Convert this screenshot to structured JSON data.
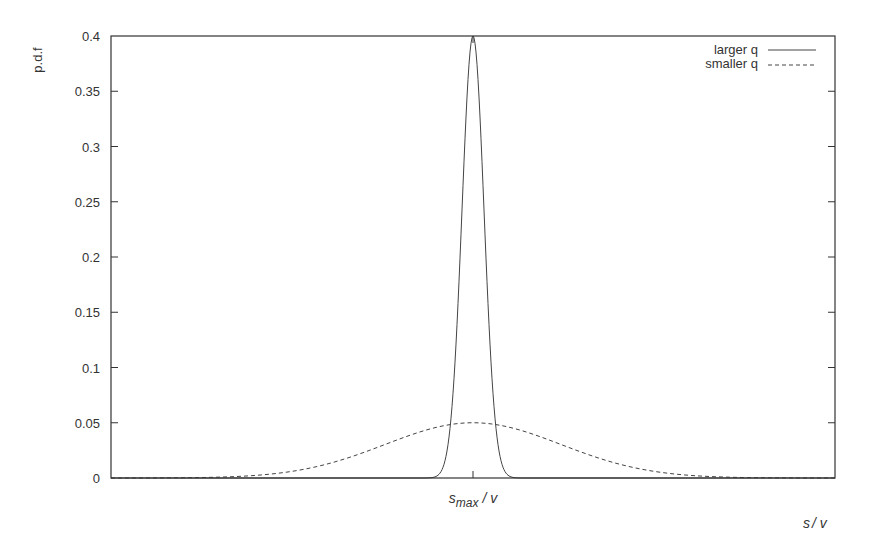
{
  "chart_data": {
    "type": "line",
    "title": "",
    "xlabel": "s/ v",
    "ylabel": "p.d.f",
    "ylim": [
      0,
      0.4
    ],
    "yticks": [
      0,
      0.05,
      0.1,
      0.15,
      0.2,
      0.25,
      0.3,
      0.35,
      0.4
    ],
    "ytick_labels": [
      "0",
      "0.05",
      "0.1",
      "0.15",
      "0.2",
      "0.25",
      "0.3",
      "0.35",
      "0.4"
    ],
    "xticks": [
      "s_max / v"
    ],
    "xtick_label": {
      "main": "s",
      "sub": "max",
      "rest": " / v"
    },
    "grid": false,
    "legend_position": "top-right",
    "series": [
      {
        "name": "larger q",
        "style": "solid",
        "shape": "gaussian",
        "center": "s_max / v",
        "peak": 0.4,
        "sigma_rel": 1
      },
      {
        "name": "smaller q",
        "style": "dashed",
        "shape": "gaussian",
        "center": "s_max / v",
        "peak": 0.05,
        "sigma_rel": 8
      }
    ]
  },
  "labels": {
    "ylabel": "p.d.f",
    "xlabel_s": "s",
    "xlabel_rest": "/ v",
    "legend": [
      "larger q",
      "smaller q"
    ]
  }
}
